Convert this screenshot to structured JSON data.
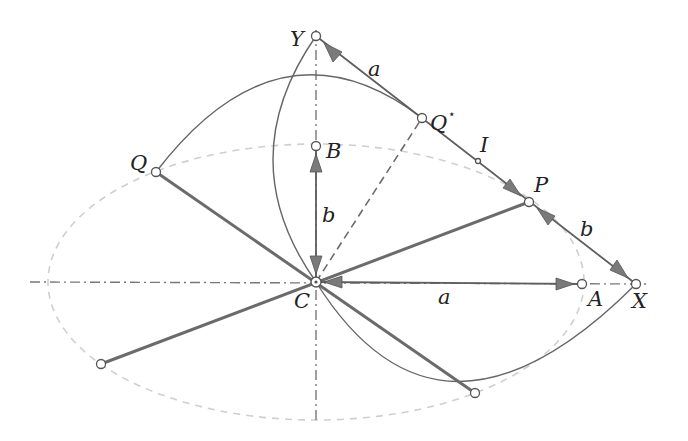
{
  "diagram": {
    "type": "geometric construction of an ellipse (trammel / conjugate diameters)",
    "points": {
      "C": {
        "label": "C",
        "x": 316,
        "y": 282
      },
      "Y": {
        "label": "Y",
        "x": 316,
        "y": 36
      },
      "B": {
        "label": "B",
        "x": 316,
        "y": 146
      },
      "Q_star": {
        "label": "Q",
        "sup": "⋆",
        "x": 422,
        "y": 118
      },
      "I": {
        "label": "I",
        "x": 478,
        "y": 161
      },
      "P": {
        "label": "P",
        "x": 529,
        "y": 202
      },
      "X": {
        "label": "X",
        "x": 636,
        "y": 284
      },
      "A": {
        "label": "A",
        "x": 582,
        "y": 284
      },
      "Q": {
        "label": "Q",
        "x": 156,
        "y": 172
      },
      "P_opp": {
        "x": 101,
        "y": 364
      },
      "Q_opp": {
        "x": 475,
        "y": 393
      }
    },
    "segment_labels": {
      "YQ": "a",
      "PX": "b",
      "CB": "b",
      "CA": "a"
    },
    "ellipse": {
      "cx": 316,
      "cy": 282,
      "rx": 268,
      "ry": 138
    },
    "colors": {
      "line": "#6b6b6b",
      "ellipse": "#cfcfcf",
      "arrowhead": "#7a7a7a",
      "text": "#222222"
    }
  }
}
